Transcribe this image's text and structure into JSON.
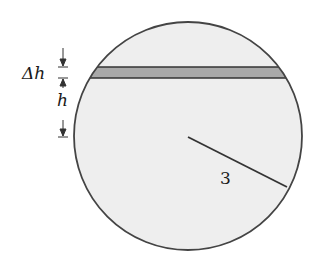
{
  "diagram": {
    "labels": {
      "delta_h": "Δh",
      "h": "h",
      "radius": "3"
    },
    "colors": {
      "circle_fill": "#eeeeee",
      "band_fill": "#a9a9a9",
      "outline": "#444444",
      "background": "#ffffff"
    },
    "geometry": {
      "circle_center": [
        188,
        136
      ],
      "circle_radius": 114,
      "band_top_y": 67,
      "band_bottom_y": 78,
      "radius_line_end": [
        287,
        187
      ]
    }
  }
}
